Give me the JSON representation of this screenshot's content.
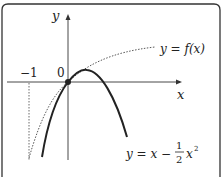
{
  "diagram": {
    "axes": {
      "x_label": "x",
      "y_label": "y",
      "origin_label": "0",
      "tick_label": "−1"
    },
    "curves": [
      {
        "name": "f",
        "label": "y = f(x)",
        "style": "dotted"
      },
      {
        "name": "parabola",
        "label_main": "y = x −",
        "frac_num": "1",
        "frac_den": "2",
        "label_tail": "x",
        "exponent": "2",
        "style": "solid"
      }
    ],
    "point": {
      "label": "origin point"
    }
  }
}
